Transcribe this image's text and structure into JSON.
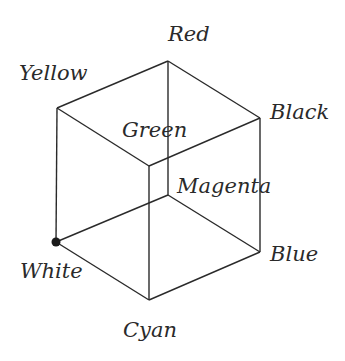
{
  "diagram": {
    "vertices": {
      "red": {
        "label": "Red",
        "x": 168,
        "y": 61
      },
      "yellow": {
        "label": "Yellow",
        "x": 57,
        "y": 108
      },
      "black": {
        "label": "Black",
        "x": 260,
        "y": 118
      },
      "green": {
        "label": "Green",
        "x": 149,
        "y": 166
      },
      "magenta": {
        "label": "Magenta",
        "x": 168,
        "y": 195
      },
      "white": {
        "label": "White",
        "x": 56,
        "y": 242
      },
      "blue": {
        "label": "Blue",
        "x": 260,
        "y": 252
      },
      "cyan": {
        "label": "Cyan",
        "x": 149,
        "y": 300
      }
    },
    "origin_marker": "White",
    "line_color": "#2a2a2a"
  }
}
